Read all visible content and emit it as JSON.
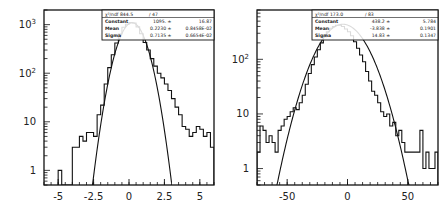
{
  "chart_data": [
    {
      "type": "bar",
      "subtype": "histogram_with_gaussian_fit",
      "title": "",
      "xlabel": "",
      "ylabel": "",
      "yscale": "log",
      "xlim": [
        -6,
        6
      ],
      "ylim": [
        0.5,
        2000
      ],
      "xticks": [
        -5,
        -2.5,
        0,
        2.5,
        5
      ],
      "xtick_labels": [
        "-5",
        "-2.5",
        "0",
        "2.5",
        "5"
      ],
      "yticks": [
        1,
        10,
        100,
        1000
      ],
      "ytick_labels": [
        "1",
        "10",
        "10^2",
        "10^3"
      ],
      "grid": false,
      "stats_box": {
        "chi2_label": "χ²/ndf",
        "chi2": "844.5",
        "ndf": "47",
        "rows": [
          {
            "name": "Constant",
            "value": "1095.",
            "error": "16.87"
          },
          {
            "name": "Mean",
            "value": "0.2230",
            "error": "0.8458E-02"
          },
          {
            "name": "Sigma",
            "value": "0.7135",
            "error": "0.6654E-02"
          }
        ]
      },
      "fit": {
        "constant": 1095,
        "mean": 0.223,
        "sigma": 0.7135
      },
      "bin_width": 0.25,
      "bins_x": [
        -5.0,
        -4.75,
        -4.5,
        -4.25,
        -4.0,
        -3.75,
        -3.5,
        -3.25,
        -3.0,
        -2.75,
        -2.5,
        -2.25,
        -2.0,
        -1.75,
        -1.5,
        -1.25,
        -1.0,
        -0.75,
        -0.5,
        -0.25,
        0.0,
        0.25,
        0.5,
        0.75,
        1.0,
        1.25,
        1.5,
        1.75,
        2.0,
        2.25,
        2.5,
        2.75,
        3.0,
        3.25,
        3.5,
        3.75,
        4.0,
        4.25,
        4.5,
        4.75,
        5.0,
        5.25,
        5.5,
        5.75
      ],
      "values": [
        1,
        0,
        0,
        0,
        3,
        3,
        5,
        4,
        6,
        6,
        5,
        14,
        22,
        60,
        130,
        240,
        420,
        640,
        880,
        1020,
        1100,
        1080,
        900,
        650,
        430,
        300,
        200,
        140,
        100,
        80,
        60,
        44,
        30,
        20,
        14,
        8,
        7,
        5,
        6,
        8,
        7,
        5,
        6,
        3
      ]
    },
    {
      "type": "bar",
      "subtype": "histogram_with_gaussian_fit",
      "title": "",
      "xlabel": "",
      "ylabel": "",
      "yscale": "log",
      "xlim": [
        -75,
        75
      ],
      "ylim": [
        0.5,
        800
      ],
      "xticks": [
        -50,
        0,
        50
      ],
      "xtick_labels": [
        "-50",
        "0",
        "50"
      ],
      "yticks": [
        1,
        10,
        100
      ],
      "ytick_labels": [
        "1",
        "10",
        "10^2"
      ],
      "grid": false,
      "stats_box": {
        "chi2_label": "χ²/ndf",
        "chi2": "173.0",
        "ndf": "83",
        "rows": [
          {
            "name": "Constant",
            "value": "438.2",
            "error": "5.784"
          },
          {
            "name": "Mean",
            "value": "-3.838",
            "error": "0.1901"
          },
          {
            "name": "Sigma",
            "value": "14.83",
            "error": "0.1347"
          }
        ]
      },
      "fit": {
        "constant": 438.2,
        "mean": -3.838,
        "sigma": 14.83
      },
      "bin_width": 2.5,
      "bins_x": [
        -75,
        -72.5,
        -70,
        -67.5,
        -65,
        -62.5,
        -60,
        -57.5,
        -55,
        -52.5,
        -50,
        -47.5,
        -45,
        -42.5,
        -40,
        -37.5,
        -35,
        -32.5,
        -30,
        -27.5,
        -25,
        -22.5,
        -20,
        -17.5,
        -15,
        -12.5,
        -10,
        -7.5,
        -5,
        -2.5,
        0,
        2.5,
        5,
        7.5,
        10,
        12.5,
        15,
        17.5,
        20,
        22.5,
        25,
        27.5,
        30,
        32.5,
        35,
        37.5,
        40,
        42.5,
        45,
        47.5,
        50,
        52.5,
        55,
        57.5,
        60,
        62.5,
        65,
        67.5,
        70,
        72.5
      ],
      "values": [
        2,
        6,
        5,
        3,
        4,
        3,
        2,
        5,
        6,
        8,
        9,
        11,
        13,
        12,
        16,
        22,
        35,
        55,
        80,
        110,
        150,
        200,
        260,
        320,
        370,
        400,
        420,
        420,
        400,
        360,
        320,
        270,
        210,
        160,
        120,
        90,
        60,
        40,
        26,
        22,
        16,
        11,
        9,
        10,
        6,
        7,
        4,
        5,
        3,
        2,
        2,
        2,
        2,
        2,
        5,
        1,
        2,
        1,
        1,
        2
      ]
    }
  ]
}
